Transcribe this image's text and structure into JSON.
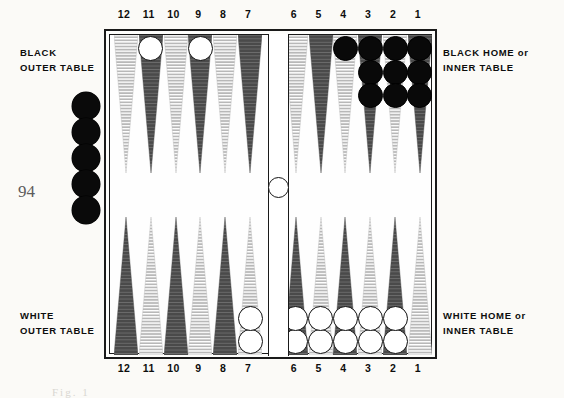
{
  "page": {
    "number": "94",
    "caption_remnant": "Fig.  1",
    "width": 564,
    "height": 398
  },
  "colors": {
    "checker_black": "#090909",
    "checker_white": "#ffffff",
    "point_dark": "#4a4a4a",
    "point_light": "#b8b8b8",
    "board_border": "#1a1a1a",
    "board_felt": "#fefefe",
    "page_background": "#fbfaf7",
    "page_number_ink": "#5c5c5c",
    "text_ink": "#0d0d0d"
  },
  "captions": {
    "black_outer": {
      "line1": "BLACK",
      "line2": "OUTER TABLE"
    },
    "white_outer": {
      "line1": "WHITE",
      "line2": "OUTER TABLE"
    },
    "black_home": {
      "line1": "BLACK HOME or",
      "line2": "INNER TABLE"
    },
    "white_home": {
      "line1": "WHITE HOME or",
      "line2": "INNER TABLE"
    }
  },
  "rails": {
    "top": [
      "12",
      "11",
      "10",
      "9",
      "8",
      "7",
      "6",
      "5",
      "4",
      "3",
      "2",
      "1"
    ],
    "bottom": [
      "12",
      "11",
      "10",
      "9",
      "8",
      "7",
      "6",
      "5",
      "4",
      "3",
      "2",
      "1"
    ]
  },
  "board": {
    "bar_checker": {
      "color": "white",
      "count": 1
    },
    "offboard_left": {
      "color": "black",
      "count": 5
    },
    "top_points": [
      {
        "label": "12",
        "quadrant": "black-outer",
        "shade": "light",
        "checkers": {
          "color": "white",
          "count": 0
        }
      },
      {
        "label": "11",
        "quadrant": "black-outer",
        "shade": "dark",
        "checkers": {
          "color": "white",
          "count": 1
        }
      },
      {
        "label": "10",
        "quadrant": "black-outer",
        "shade": "light",
        "checkers": {
          "color": "white",
          "count": 0
        }
      },
      {
        "label": "9",
        "quadrant": "black-outer",
        "shade": "dark",
        "checkers": {
          "color": "white",
          "count": 1
        }
      },
      {
        "label": "8",
        "quadrant": "black-outer",
        "shade": "light",
        "checkers": {
          "color": "white",
          "count": 0
        }
      },
      {
        "label": "7",
        "quadrant": "black-outer",
        "shade": "dark",
        "checkers": {
          "color": "white",
          "count": 0
        }
      },
      {
        "label": "6",
        "quadrant": "black-home",
        "shade": "light",
        "checkers": {
          "color": "black",
          "count": 0
        }
      },
      {
        "label": "5",
        "quadrant": "black-home",
        "shade": "dark",
        "checkers": {
          "color": "black",
          "count": 0
        }
      },
      {
        "label": "4",
        "quadrant": "black-home",
        "shade": "light",
        "checkers": {
          "color": "black",
          "count": 1
        }
      },
      {
        "label": "3",
        "quadrant": "black-home",
        "shade": "dark",
        "checkers": {
          "color": "black",
          "count": 3
        }
      },
      {
        "label": "2",
        "quadrant": "black-home",
        "shade": "light",
        "checkers": {
          "color": "black",
          "count": 3
        }
      },
      {
        "label": "1",
        "quadrant": "black-home",
        "shade": "dark",
        "checkers": {
          "color": "black",
          "count": 3
        }
      }
    ],
    "bottom_points": [
      {
        "label": "12",
        "quadrant": "white-outer",
        "shade": "dark",
        "checkers": {
          "color": "white",
          "count": 0
        }
      },
      {
        "label": "11",
        "quadrant": "white-outer",
        "shade": "light",
        "checkers": {
          "color": "white",
          "count": 0
        }
      },
      {
        "label": "10",
        "quadrant": "white-outer",
        "shade": "dark",
        "checkers": {
          "color": "white",
          "count": 0
        }
      },
      {
        "label": "9",
        "quadrant": "white-outer",
        "shade": "light",
        "checkers": {
          "color": "white",
          "count": 0
        }
      },
      {
        "label": "8",
        "quadrant": "white-outer",
        "shade": "dark",
        "checkers": {
          "color": "white",
          "count": 0
        }
      },
      {
        "label": "7",
        "quadrant": "white-outer",
        "shade": "light",
        "checkers": {
          "color": "white",
          "count": 2
        }
      },
      {
        "label": "6",
        "quadrant": "white-home",
        "shade": "dark",
        "checkers": {
          "color": "white",
          "count": 2
        }
      },
      {
        "label": "5",
        "quadrant": "white-home",
        "shade": "light",
        "checkers": {
          "color": "white",
          "count": 2
        }
      },
      {
        "label": "4",
        "quadrant": "white-home",
        "shade": "dark",
        "checkers": {
          "color": "white",
          "count": 2
        }
      },
      {
        "label": "3",
        "quadrant": "white-home",
        "shade": "light",
        "checkers": {
          "color": "white",
          "count": 2
        }
      },
      {
        "label": "2",
        "quadrant": "white-home",
        "shade": "dark",
        "checkers": {
          "color": "white",
          "count": 2
        }
      },
      {
        "label": "1",
        "quadrant": "white-home",
        "shade": "light",
        "checkers": {
          "color": "white",
          "count": 0
        }
      }
    ]
  }
}
